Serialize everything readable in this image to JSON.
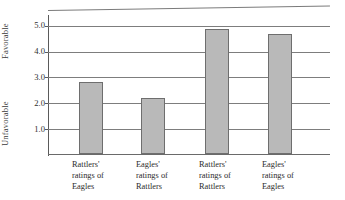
{
  "chart_data": {
    "type": "bar",
    "title": "",
    "xlabel": "",
    "ylabel": "",
    "categories": [
      "Rattlers' ratings of Eagles",
      "Eagles' ratings of Rattlers",
      "Rattlers' ratings of Rattlers",
      "Eagles' ratings of Eagles"
    ],
    "values": [
      2.8,
      2.15,
      4.85,
      4.65
    ],
    "ylim": [
      0,
      5.3
    ],
    "yticks": [
      1.0,
      2.0,
      3.0,
      4.0,
      5.0
    ],
    "ytick_labels": [
      "1.0",
      "2.0",
      "3.0",
      "4.0",
      "5.0"
    ],
    "grid": true,
    "legend": "none",
    "bar_color": "#b9b9b9",
    "bar_edge_color": "#6e6e6e",
    "gridline_color": "#7d7d7d",
    "axis_color": "#5a5a5a"
  },
  "axis": {
    "y_top_group_label": "Favorable",
    "y_bottom_group_label": "Unfavorable"
  },
  "ticks": [
    {
      "label": "5.0",
      "value": 5.0
    },
    {
      "label": "4.0",
      "value": 4.0
    },
    {
      "label": "3.0",
      "value": 3.0
    },
    {
      "label": "2.0",
      "value": 2.0
    },
    {
      "label": "1.0",
      "value": 1.0
    }
  ],
  "bars": [
    {
      "value": 2.8,
      "label_line1": "Rattlers'",
      "label_line2": "ratings of",
      "label_line3": "Eagles"
    },
    {
      "value": 2.15,
      "label_line1": "Eagles'",
      "label_line2": "ratings of",
      "label_line3": "Rattlers"
    },
    {
      "value": 4.85,
      "label_line1": "Rattlers'",
      "label_line2": "ratings of",
      "label_line3": "Rattlers"
    },
    {
      "value": 4.65,
      "label_line1": "Eagles'",
      "label_line2": "ratings of",
      "label_line3": "Eagles"
    }
  ]
}
